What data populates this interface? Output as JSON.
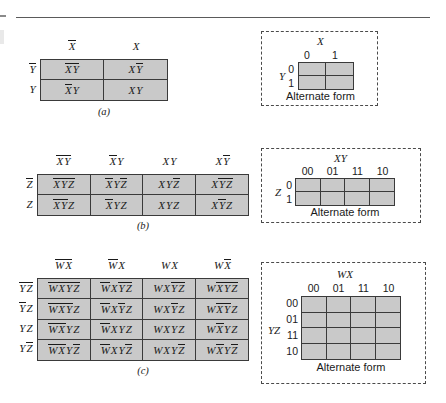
{
  "figure": {
    "rule_present": true
  },
  "maps": [
    {
      "id": "a",
      "caption": "(a)",
      "col_headers": [
        {
          "parts": [
            {
              "t": "X",
              "bar": true
            }
          ]
        },
        {
          "parts": [
            {
              "t": "X",
              "bar": false
            }
          ]
        }
      ],
      "row_headers": [
        {
          "parts": [
            {
              "t": "Y",
              "bar": true
            }
          ]
        },
        {
          "parts": [
            {
              "t": "Y",
              "bar": false
            }
          ]
        }
      ],
      "cells": [
        [
          {
            "parts": [
              {
                "t": "X",
                "bar": true
              },
              {
                "t": "Y",
                "bar": true
              }
            ]
          },
          {
            "parts": [
              {
                "t": "X",
                "bar": false
              },
              {
                "t": "Y",
                "bar": true
              }
            ]
          }
        ],
        [
          {
            "parts": [
              {
                "t": "X",
                "bar": true
              },
              {
                "t": "Y",
                "bar": false
              }
            ]
          },
          {
            "parts": [
              {
                "t": "X",
                "bar": false
              },
              {
                "t": "Y",
                "bar": false
              }
            ]
          }
        ]
      ],
      "alternate": {
        "top_var": "X",
        "side_var": "Y",
        "col_labels": [
          "0",
          "1"
        ],
        "row_labels": [
          "0",
          "1"
        ],
        "caption": "Alternate form"
      }
    },
    {
      "id": "b",
      "caption": "(b)",
      "col_headers": [
        {
          "parts": [
            {
              "t": "X",
              "bar": true
            },
            {
              "t": "Y",
              "bar": true
            }
          ]
        },
        {
          "parts": [
            {
              "t": "X",
              "bar": true
            },
            {
              "t": "Y",
              "bar": false
            }
          ]
        },
        {
          "parts": [
            {
              "t": "X",
              "bar": false
            },
            {
              "t": "Y",
              "bar": false
            }
          ]
        },
        {
          "parts": [
            {
              "t": "X",
              "bar": false
            },
            {
              "t": "Y",
              "bar": true
            }
          ]
        }
      ],
      "row_headers": [
        {
          "parts": [
            {
              "t": "Z",
              "bar": true
            }
          ]
        },
        {
          "parts": [
            {
              "t": "Z",
              "bar": false
            }
          ]
        }
      ],
      "cells": [
        [
          {
            "parts": [
              {
                "t": "X",
                "bar": true
              },
              {
                "t": "Y",
                "bar": true
              },
              {
                "t": "Z",
                "bar": true
              }
            ]
          },
          {
            "parts": [
              {
                "t": "X",
                "bar": true
              },
              {
                "t": "Y",
                "bar": false
              },
              {
                "t": "Z",
                "bar": true
              }
            ]
          },
          {
            "parts": [
              {
                "t": "X",
                "bar": false
              },
              {
                "t": "Y",
                "bar": false
              },
              {
                "t": "Z",
                "bar": true
              }
            ]
          },
          {
            "parts": [
              {
                "t": "X",
                "bar": false
              },
              {
                "t": "Y",
                "bar": true
              },
              {
                "t": "Z",
                "bar": true
              }
            ]
          }
        ],
        [
          {
            "parts": [
              {
                "t": "X",
                "bar": true
              },
              {
                "t": "Y",
                "bar": true
              },
              {
                "t": "Z",
                "bar": false
              }
            ]
          },
          {
            "parts": [
              {
                "t": "X",
                "bar": true
              },
              {
                "t": "Y",
                "bar": false
              },
              {
                "t": "Z",
                "bar": false
              }
            ]
          },
          {
            "parts": [
              {
                "t": "X",
                "bar": false
              },
              {
                "t": "Y",
                "bar": false
              },
              {
                "t": "Z",
                "bar": false
              }
            ]
          },
          {
            "parts": [
              {
                "t": "X",
                "bar": false
              },
              {
                "t": "Y",
                "bar": true
              },
              {
                "t": "Z",
                "bar": false
              }
            ]
          }
        ]
      ],
      "alternate": {
        "top_var": "XY",
        "side_var": "Z",
        "col_labels": [
          "00",
          "01",
          "11",
          "10"
        ],
        "row_labels": [
          "0",
          "1"
        ],
        "caption": "Alternate form"
      }
    },
    {
      "id": "c",
      "caption": "(c)",
      "col_headers": [
        {
          "parts": [
            {
              "t": "W",
              "bar": true
            },
            {
              "t": "X",
              "bar": true
            }
          ]
        },
        {
          "parts": [
            {
              "t": "W",
              "bar": true
            },
            {
              "t": "X",
              "bar": false
            }
          ]
        },
        {
          "parts": [
            {
              "t": "W",
              "bar": false
            },
            {
              "t": "X",
              "bar": false
            }
          ]
        },
        {
          "parts": [
            {
              "t": "W",
              "bar": false
            },
            {
              "t": "X",
              "bar": true
            }
          ]
        }
      ],
      "row_headers": [
        {
          "parts": [
            {
              "t": "Y",
              "bar": true
            },
            {
              "t": "Z",
              "bar": true
            }
          ]
        },
        {
          "parts": [
            {
              "t": "Y",
              "bar": true
            },
            {
              "t": "Z",
              "bar": false
            }
          ]
        },
        {
          "parts": [
            {
              "t": "Y",
              "bar": false
            },
            {
              "t": "Z",
              "bar": false
            }
          ]
        },
        {
          "parts": [
            {
              "t": "Y",
              "bar": false
            },
            {
              "t": "Z",
              "bar": true
            }
          ]
        }
      ],
      "cells": [
        [
          {
            "parts": [
              {
                "t": "W",
                "bar": true
              },
              {
                "t": "X",
                "bar": true
              },
              {
                "t": "Y",
                "bar": true
              },
              {
                "t": "Z",
                "bar": true
              }
            ]
          },
          {
            "parts": [
              {
                "t": "W",
                "bar": true
              },
              {
                "t": "X",
                "bar": false
              },
              {
                "t": "Y",
                "bar": true
              },
              {
                "t": "Z",
                "bar": true
              }
            ]
          },
          {
            "parts": [
              {
                "t": "W",
                "bar": false
              },
              {
                "t": "X",
                "bar": false
              },
              {
                "t": "Y",
                "bar": true
              },
              {
                "t": "Z",
                "bar": true
              }
            ]
          },
          {
            "parts": [
              {
                "t": "W",
                "bar": false
              },
              {
                "t": "X",
                "bar": true
              },
              {
                "t": "Y",
                "bar": true
              },
              {
                "t": "Z",
                "bar": true
              }
            ]
          }
        ],
        [
          {
            "parts": [
              {
                "t": "W",
                "bar": true
              },
              {
                "t": "X",
                "bar": true
              },
              {
                "t": "Y",
                "bar": true
              },
              {
                "t": "Z",
                "bar": false
              }
            ]
          },
          {
            "parts": [
              {
                "t": "W",
                "bar": true
              },
              {
                "t": "X",
                "bar": false
              },
              {
                "t": "Y",
                "bar": true
              },
              {
                "t": "Z",
                "bar": false
              }
            ]
          },
          {
            "parts": [
              {
                "t": "W",
                "bar": false
              },
              {
                "t": "X",
                "bar": false
              },
              {
                "t": "Y",
                "bar": true
              },
              {
                "t": "Z",
                "bar": false
              }
            ]
          },
          {
            "parts": [
              {
                "t": "W",
                "bar": false
              },
              {
                "t": "X",
                "bar": true
              },
              {
                "t": "Y",
                "bar": true
              },
              {
                "t": "Z",
                "bar": false
              }
            ]
          }
        ],
        [
          {
            "parts": [
              {
                "t": "W",
                "bar": true
              },
              {
                "t": "X",
                "bar": true
              },
              {
                "t": "Y",
                "bar": false
              },
              {
                "t": "Z",
                "bar": false
              }
            ]
          },
          {
            "parts": [
              {
                "t": "W",
                "bar": true
              },
              {
                "t": "X",
                "bar": false
              },
              {
                "t": "Y",
                "bar": false
              },
              {
                "t": "Z",
                "bar": false
              }
            ]
          },
          {
            "parts": [
              {
                "t": "W",
                "bar": false
              },
              {
                "t": "X",
                "bar": false
              },
              {
                "t": "Y",
                "bar": false
              },
              {
                "t": "Z",
                "bar": false
              }
            ]
          },
          {
            "parts": [
              {
                "t": "W",
                "bar": false
              },
              {
                "t": "X",
                "bar": true
              },
              {
                "t": "Y",
                "bar": false
              },
              {
                "t": "Z",
                "bar": false
              }
            ]
          }
        ],
        [
          {
            "parts": [
              {
                "t": "W",
                "bar": true
              },
              {
                "t": "X",
                "bar": true
              },
              {
                "t": "Y",
                "bar": false
              },
              {
                "t": "Z",
                "bar": true
              }
            ]
          },
          {
            "parts": [
              {
                "t": "W",
                "bar": true
              },
              {
                "t": "X",
                "bar": false
              },
              {
                "t": "Y",
                "bar": false
              },
              {
                "t": "Z",
                "bar": true
              }
            ]
          },
          {
            "parts": [
              {
                "t": "W",
                "bar": false
              },
              {
                "t": "X",
                "bar": false
              },
              {
                "t": "Y",
                "bar": false
              },
              {
                "t": "Z",
                "bar": true
              }
            ]
          },
          {
            "parts": [
              {
                "t": "W",
                "bar": false
              },
              {
                "t": "X",
                "bar": true
              },
              {
                "t": "Y",
                "bar": false
              },
              {
                "t": "Z",
                "bar": true
              }
            ]
          }
        ]
      ],
      "alternate": {
        "top_var": "WX",
        "side_var": "YZ",
        "col_labels": [
          "00",
          "01",
          "11",
          "10"
        ],
        "row_labels": [
          "00",
          "01",
          "11",
          "10"
        ],
        "caption": "Alternate form"
      }
    }
  ],
  "colors": {
    "cell_fill": "#c9c9c9",
    "grid_line": "#3a3a3a",
    "dashed_border": "#4a4a4a",
    "text": "#1a1a1a"
  }
}
